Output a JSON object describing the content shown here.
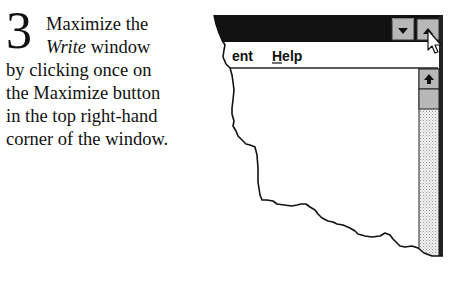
{
  "step": {
    "number": "3",
    "lines": {
      "l1": "Maximize the",
      "l2_italic": "Write",
      "l2_rest": " window",
      "l3": "by clicking once on",
      "l4": "the Maximize button",
      "l5": "in the top right-hand",
      "l6": "corner of the window."
    }
  },
  "screenshot": {
    "menu_partial": "ent",
    "menu_help": "Help",
    "help_mnemonic": "H",
    "help_rest": "elp",
    "title_bar_color": "#111111",
    "button_color": "#b8b8b8",
    "buttons": [
      "minimize-button",
      "maximize-button"
    ]
  }
}
